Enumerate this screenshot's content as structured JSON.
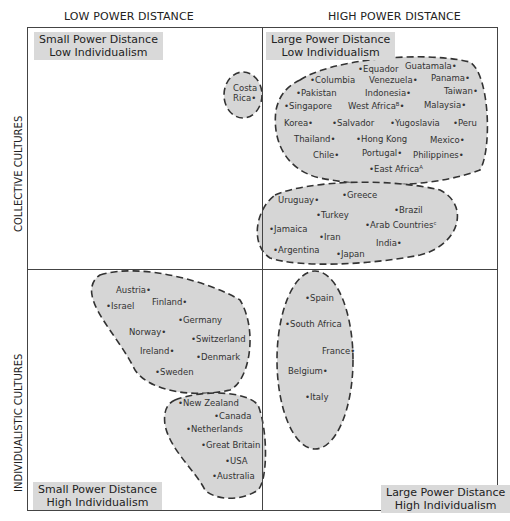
{
  "axes": {
    "top_left": "LOW POWER DISTANCE",
    "top_right": "HIGH POWER DISTANCE",
    "left_top": "COLLECTIVE CULTURES",
    "left_bottom": "INDIVIDUALISTIC CULTURES"
  },
  "quadrants": {
    "top_left": {
      "line1": "Small Power Distance",
      "line2": "Low Individualism"
    },
    "top_right": {
      "line1": "Large Power Distance",
      "line2": "Low Individualism"
    },
    "bottom_left": {
      "line1": "Small Power Distance",
      "line2": "High Individualism"
    },
    "bottom_right": {
      "line1": "Large Power Distance",
      "line2": "High Individualism"
    }
  },
  "clusters": {
    "costa_rica": [
      "Costa",
      "Rica•"
    ],
    "latin_asian": [
      "•Equador",
      "Guatamala•",
      "•Columbia",
      "Venezuela•",
      "Panama•",
      "•Pakistan",
      "Indonesia•",
      "Taiwan•",
      "•Singapore",
      "West Africaᴮ•",
      "Malaysia•",
      "Korea•",
      "•Salvador",
      "•Yugoslavia",
      "•Peru",
      "Thailand•",
      "•Hong Kong",
      "Mexico•",
      "Chile•",
      "Portugal•",
      "Philippines•",
      "•East Africaᴬ"
    ],
    "mediterranean": [
      "•Greece",
      "Uruguay•",
      "•Brazil",
      "•Turkey",
      "•Jamaica",
      "•Arab Countriesᶜ",
      "•Iran",
      "India•",
      "•Argentina",
      "•Japan"
    ],
    "nordic_germanic": [
      "Austria•",
      "•Israel",
      "Finland•",
      "•Germany",
      "Norway•",
      "•Switzerland",
      "Ireland•",
      "•Denmark",
      "•Sweden"
    ],
    "anglo": [
      "•New Zealand",
      "•Canada",
      "•Netherlands",
      "•Great Britain",
      "•USA",
      "•Australia"
    ],
    "latin_european": [
      "•Spain",
      "•South Africa",
      "France•",
      "Belgium•",
      "•Italy"
    ]
  },
  "colors": {
    "blob_fill": "#d6d6d6",
    "label_bg": "#d9d9d9",
    "line": "#444444"
  }
}
